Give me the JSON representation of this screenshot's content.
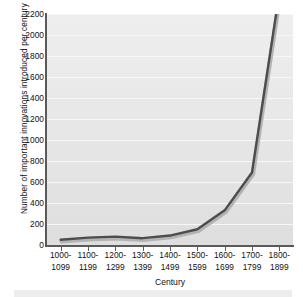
{
  "chart_data": {
    "type": "line",
    "title": "",
    "xlabel": "Century",
    "ylabel": "Number of important innovations introduced per century",
    "categories": [
      "1000–1099",
      "1100–1199",
      "1200–1299",
      "1300–1399",
      "1400–1499",
      "1500–1599",
      "1600–1699",
      "1700–1799",
      "1800–1899"
    ],
    "categories_line1": [
      "1000-",
      "1100-",
      "1200-",
      "1300-",
      "1400-",
      "1500-",
      "1600-",
      "1700-",
      "1800-"
    ],
    "categories_line2": [
      "1099",
      "1199",
      "1299",
      "1399",
      "1499",
      "1599",
      "1699",
      "1799",
      "1899"
    ],
    "values": [
      50,
      70,
      80,
      65,
      90,
      150,
      330,
      690,
      2400
    ],
    "ylim": [
      0,
      2200
    ],
    "yticks": [
      0,
      200,
      400,
      600,
      800,
      1000,
      1200,
      1400,
      1600,
      1800,
      2000,
      2200
    ],
    "ytick_labels": [
      "0",
      "200",
      "400",
      "600",
      "800",
      "1000",
      "1200",
      "1400",
      "1600",
      "1800",
      "2000",
      "2200"
    ],
    "grid": true,
    "legend": "none",
    "series": [
      {
        "name": "Important innovations",
        "values": [
          50,
          70,
          80,
          65,
          90,
          150,
          330,
          690,
          2400
        ],
        "line_color": "#4d4d4d",
        "shadow_color": "#b3b3b3",
        "line_width": 2.4,
        "clipped_at_top": true
      }
    ],
    "colors": {
      "plot_background": "#e8e8e8",
      "gridline": "#f7f7f7",
      "axis": "#5a5a5a",
      "text": "#111111",
      "figure_background": "#ffffff"
    }
  }
}
